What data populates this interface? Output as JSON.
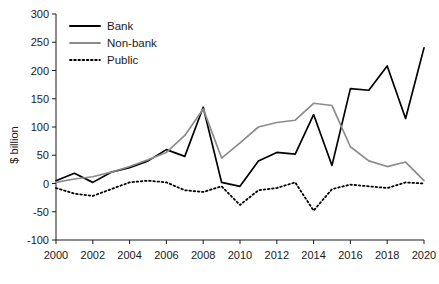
{
  "chart_data": {
    "type": "line",
    "title": "",
    "xlabel": "",
    "ylabel": "$ billion",
    "xlim": [
      2000,
      2020
    ],
    "ylim": [
      -100,
      300
    ],
    "yticks": [
      -100,
      -50,
      0,
      50,
      100,
      150,
      200,
      250,
      300
    ],
    "ytick_labels": [
      "-100",
      "-50",
      "0",
      "50",
      "100",
      "150",
      "200",
      "250",
      "300"
    ],
    "xticks": [
      2000,
      2002,
      2004,
      2006,
      2008,
      2010,
      2012,
      2014,
      2016,
      2018,
      2020
    ],
    "xtick_labels": [
      "2000",
      "2002",
      "2004",
      "2006",
      "2008",
      "2010",
      "2012",
      "2014",
      "2016",
      "2018",
      "2020"
    ],
    "grid": false,
    "legend_position": "top-left",
    "x": [
      2000,
      2001,
      2002,
      2003,
      2004,
      2005,
      2006,
      2007,
      2008,
      2009,
      2010,
      2011,
      2012,
      2013,
      2014,
      2015,
      2016,
      2017,
      2018,
      2019,
      2020
    ],
    "series": [
      {
        "name": "Bank",
        "color": "#000000",
        "style": "solid",
        "values": [
          5,
          18,
          2,
          20,
          28,
          40,
          60,
          48,
          135,
          2,
          -5,
          40,
          55,
          52,
          122,
          32,
          168,
          165,
          208,
          115,
          240
        ]
      },
      {
        "name": "Non-bank",
        "color": "#8c8c8c",
        "style": "solid",
        "values": [
          2,
          8,
          12,
          20,
          30,
          42,
          55,
          85,
          132,
          45,
          72,
          100,
          108,
          112,
          142,
          138,
          65,
          40,
          30,
          38,
          5
        ]
      },
      {
        "name": "Public",
        "color": "#000000",
        "style": "dotted",
        "values": [
          -8,
          -18,
          -22,
          -10,
          2,
          5,
          2,
          -12,
          -15,
          -5,
          -38,
          -12,
          -8,
          2,
          -48,
          -10,
          -2,
          -5,
          -8,
          2,
          0
        ]
      }
    ]
  },
  "legend": {
    "items": [
      {
        "label": "Bank"
      },
      {
        "label": "Non-bank"
      },
      {
        "label": "Public"
      }
    ]
  },
  "axis": {
    "y_title": "$ billion"
  }
}
